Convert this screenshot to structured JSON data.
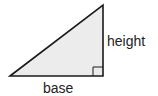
{
  "diagram": {
    "type": "right-triangle",
    "labels": {
      "height": "height",
      "base": "base"
    },
    "right_angle_marker": true,
    "colors": {
      "fill": "#ececec",
      "stroke": "#1a1a1a",
      "text": "#222222"
    }
  }
}
